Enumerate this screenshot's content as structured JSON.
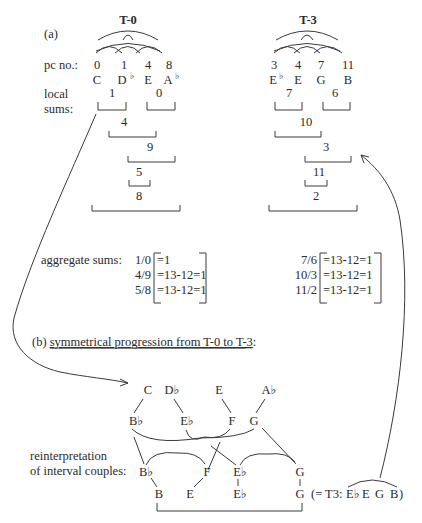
{
  "part_a": {
    "label": "(a)",
    "row_label_pc": "pc no.:",
    "row_label_local_1": "local",
    "row_label_local_2": "sums:",
    "t0": {
      "title": "T-0",
      "pcs": [
        "0",
        "1",
        "4",
        "8"
      ],
      "notes": [
        "C",
        "D",
        "E",
        "A"
      ],
      "note_flats": [
        "",
        "♭",
        "",
        "♭"
      ],
      "local_sums": [
        "1",
        "0",
        "4",
        "9",
        "5",
        "8"
      ]
    },
    "t3": {
      "title": "T-3",
      "pcs": [
        "3",
        "4",
        "7",
        "11"
      ],
      "notes": [
        "E",
        "E",
        "G",
        "B"
      ],
      "note_flats": [
        "♭",
        "",
        "",
        ""
      ],
      "local_sums": [
        "7",
        "6",
        "10",
        "3",
        "11",
        "2"
      ]
    },
    "aggregate": {
      "label": "aggregate sums:",
      "t0": [
        {
          "pair": "1/0",
          "eq": "=1"
        },
        {
          "pair": "4/9",
          "eq": "=13-12=1"
        },
        {
          "pair": "5/8",
          "eq": "=13-12=1"
        }
      ],
      "t3": [
        {
          "pair": "7/6",
          "eq": "=13-12=1"
        },
        {
          "pair": "10/3",
          "eq": "=13-12=1"
        },
        {
          "pair": "11/2",
          "eq": "=13-12=1"
        }
      ]
    }
  },
  "part_b": {
    "label_prefix": "(b) ",
    "label": "symmetrical progression from T-0 to T-3",
    "label_suffix": ":",
    "top_row": [
      "C",
      "D♭",
      "E",
      "A♭"
    ],
    "second_row": [
      "B♭",
      "E♭",
      "F",
      "G"
    ],
    "reinterp_label_1": "reinterpretation",
    "reinterp_label_2": "of interval couples:",
    "third_row": [
      "B♭",
      "F",
      "E♭",
      "G"
    ],
    "bottom_row": [
      "B",
      "E",
      "E♭",
      "G"
    ],
    "result_prefix": "(= T3: ",
    "result_notes": [
      "E♭",
      "E",
      "G",
      "B"
    ],
    "result_suffix": ")"
  }
}
